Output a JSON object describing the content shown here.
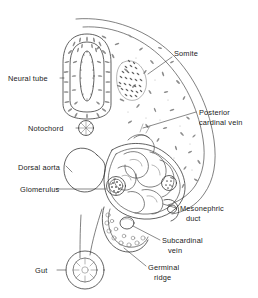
{
  "figure": {
    "background_color": "#ffffff",
    "ink_color": "#4a4a4a",
    "text_color": "#1a1a1a",
    "width": 258,
    "height": 298
  },
  "labels": {
    "neural_tube": "Neural tube",
    "somite": "Somite",
    "notochord": "Notochord",
    "posterior_cardinal_vein_line1": "Posterior",
    "posterior_cardinal_vein_line2": "cardinal vein",
    "dorsal_aorta": "Dorsal aorta",
    "glomerulus": "Glomerulus",
    "mesonephric_duct_line1": "Mesonephric",
    "mesonephric_duct_line2": "duct",
    "subcardinal_vein_line1": "Subcardinal",
    "subcardinal_vein_line2": "vein",
    "germinal_ridge_line1": "Germinal",
    "germinal_ridge_line2": "ridge",
    "gut": "Gut"
  },
  "structures": [
    {
      "id": "body-wall",
      "name": "body wall outline"
    },
    {
      "id": "neural-tube",
      "name": "neural tube"
    },
    {
      "id": "somite",
      "name": "somite"
    },
    {
      "id": "notochord",
      "name": "notochord"
    },
    {
      "id": "posterior-cardinal-vein",
      "name": "posterior cardinal vein"
    },
    {
      "id": "dorsal-aorta",
      "name": "dorsal aorta"
    },
    {
      "id": "glomerulus",
      "name": "glomerulus"
    },
    {
      "id": "mesonephric-duct",
      "name": "mesonephric duct"
    },
    {
      "id": "subcardinal-vein",
      "name": "subcardinal vein"
    },
    {
      "id": "germinal-ridge",
      "name": "germinal ridge"
    },
    {
      "id": "gut",
      "name": "gut"
    },
    {
      "id": "mesonephros",
      "name": "mesonephric tubules"
    }
  ]
}
